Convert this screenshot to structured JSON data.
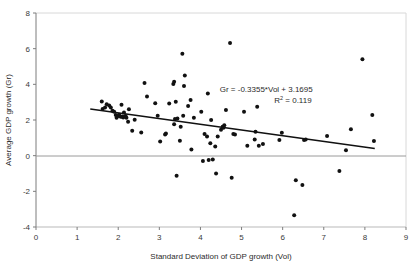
{
  "chart_data": {
    "type": "scatter",
    "title": "",
    "xlabel": "Standard Deviation of GDP growth (Vol)",
    "ylabel": "Average GDP growth (Gr)",
    "xlim": [
      0,
      9
    ],
    "ylim": [
      -4,
      8
    ],
    "xticks": [
      0,
      1,
      2,
      3,
      4,
      5,
      6,
      7,
      8,
      9
    ],
    "yticks": [
      -4,
      -2,
      0,
      2,
      4,
      6,
      8
    ],
    "xtick_labels": [
      "0",
      "1",
      "2",
      "3",
      "4",
      "5",
      "6",
      "7",
      "8",
      "9"
    ],
    "ytick_labels": [
      "-4",
      "-2",
      "0",
      "2",
      "4",
      "6",
      "8"
    ],
    "grid": false,
    "legend": "none",
    "marker": {
      "shape": "circle",
      "color": "#111111",
      "size": 2.0
    },
    "zero_line": {
      "value": 0,
      "color": "#9a9a9a"
    },
    "annotations": [
      {
        "name": "regression-equation",
        "text": "Gr = -0.3355*Vol + 3.1695",
        "x": 5.6,
        "y": 3.55
      },
      {
        "name": "r-squared",
        "text": "R2 = 0.119",
        "display": "R² = 0.119",
        "x": 6.25,
        "y": 2.95
      }
    ],
    "trendline": {
      "type": "linear",
      "slope": -0.3355,
      "intercept": 3.1695,
      "color": "#111111",
      "width": 1.6,
      "x_start": 1.32,
      "x_end": 8.24,
      "y_start": 2.62,
      "y_end": 0.4
    },
    "points": [
      [
        1.6,
        3.04
      ],
      [
        1.62,
        2.62
      ],
      [
        1.68,
        2.7
      ],
      [
        1.72,
        2.88
      ],
      [
        1.78,
        2.82
      ],
      [
        1.82,
        2.7
      ],
      [
        1.86,
        2.52
      ],
      [
        1.9,
        2.46
      ],
      [
        1.94,
        2.28
      ],
      [
        1.96,
        2.12
      ],
      [
        2.0,
        2.22
      ],
      [
        2.02,
        2.3
      ],
      [
        2.06,
        2.18
      ],
      [
        2.08,
        2.86
      ],
      [
        2.1,
        2.2
      ],
      [
        2.12,
        2.14
      ],
      [
        2.14,
        2.42
      ],
      [
        2.18,
        2.22
      ],
      [
        2.2,
        2.12
      ],
      [
        2.24,
        1.9
      ],
      [
        2.26,
        2.6
      ],
      [
        2.34,
        1.4
      ],
      [
        2.4,
        2.02
      ],
      [
        2.56,
        1.3
      ],
      [
        2.64,
        4.08
      ],
      [
        2.7,
        3.32
      ],
      [
        2.9,
        2.94
      ],
      [
        2.96,
        2.24
      ],
      [
        3.02,
        0.8
      ],
      [
        3.14,
        1.18
      ],
      [
        3.16,
        1.24
      ],
      [
        3.24,
        2.92
      ],
      [
        3.34,
        4.02
      ],
      [
        3.36,
        4.14
      ],
      [
        3.36,
        1.76
      ],
      [
        3.38,
        2.06
      ],
      [
        3.4,
        3.02
      ],
      [
        3.42,
        -1.12
      ],
      [
        3.44,
        2.08
      ],
      [
        3.5,
        0.84
      ],
      [
        3.52,
        1.62
      ],
      [
        3.56,
        5.72
      ],
      [
        3.58,
        2.24
      ],
      [
        3.6,
        3.9
      ],
      [
        3.62,
        4.5
      ],
      [
        3.7,
        2.78
      ],
      [
        3.76,
        3.12
      ],
      [
        3.78,
        0.34
      ],
      [
        3.84,
        2.12
      ],
      [
        4.02,
        2.46
      ],
      [
        4.06,
        -0.3
      ],
      [
        4.1,
        1.22
      ],
      [
        4.16,
        1.08
      ],
      [
        4.18,
        3.48
      ],
      [
        4.2,
        -0.24
      ],
      [
        4.24,
        0.7
      ],
      [
        4.26,
        2.0
      ],
      [
        4.3,
        -0.22
      ],
      [
        4.36,
        0.52
      ],
      [
        4.38,
        -1.0
      ],
      [
        4.42,
        1.08
      ],
      [
        4.5,
        1.46
      ],
      [
        4.54,
        1.62
      ],
      [
        4.56,
        1.56
      ],
      [
        4.58,
        1.7
      ],
      [
        4.62,
        2.56
      ],
      [
        4.72,
        6.32
      ],
      [
        4.76,
        -1.24
      ],
      [
        4.8,
        1.22
      ],
      [
        4.84,
        1.18
      ],
      [
        5.06,
        2.46
      ],
      [
        5.14,
        0.56
      ],
      [
        5.32,
        0.9
      ],
      [
        5.34,
        1.34
      ],
      [
        5.38,
        2.74
      ],
      [
        5.42,
        0.56
      ],
      [
        5.52,
        0.66
      ],
      [
        5.92,
        0.88
      ],
      [
        5.98,
        1.28
      ],
      [
        6.28,
        -3.34
      ],
      [
        6.32,
        -1.38
      ],
      [
        6.48,
        -1.64
      ],
      [
        6.52,
        0.88
      ],
      [
        6.56,
        0.9
      ],
      [
        7.08,
        1.1
      ],
      [
        7.38,
        -0.86
      ],
      [
        7.54,
        0.3
      ],
      [
        7.66,
        1.48
      ],
      [
        7.94,
        5.4
      ],
      [
        8.18,
        2.28
      ],
      [
        8.22,
        0.82
      ]
    ]
  },
  "axes": {
    "x_title": "Standard Deviation of GDP growth (Vol)",
    "y_title": "Average GDP growth (Gr)"
  }
}
